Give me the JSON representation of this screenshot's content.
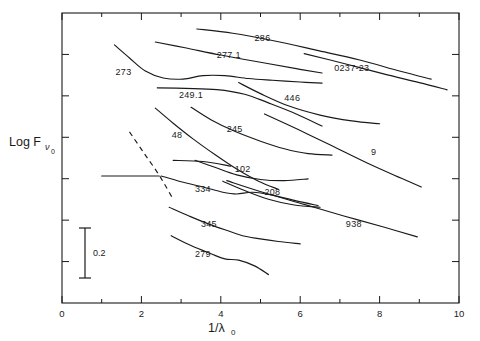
{
  "figure": {
    "kind": "scientific-line-plot",
    "background_color": "#ffffff",
    "ink_color": "#1a1a1a"
  },
  "axes": {
    "x_label": "1/λ",
    "x_label_sub": "0",
    "y_label": "Log F",
    "y_label_sub_nu": "ν",
    "y_label_sub_zero": "0",
    "x_ticks": [
      "0",
      "2",
      "4",
      "6",
      "8",
      "10"
    ],
    "x_tick_values": [
      0,
      2,
      4,
      6,
      8,
      10
    ],
    "x_minor_tick_values": [
      1,
      3,
      5,
      7,
      9
    ],
    "xlim": [
      0,
      10
    ],
    "y_tick_count": 6,
    "frame": "box",
    "grid": false
  },
  "scalebar": {
    "label": "0.2",
    "value": 0.2
  },
  "chart_data": {
    "type": "line",
    "title": "",
    "xlabel": "1/λ0",
    "ylabel": "Log Fν0",
    "xlim": [
      0,
      10
    ],
    "ylim": [
      0,
      1
    ],
    "grid": false,
    "legend": "inline-curve-labels",
    "note": "Y axis is relative log flux with arbitrary offsets per curve; only a 0.2 dex scale bar is given. Curve x values read from the 1/λ0 axis, y values are normalized figure coordinates (1 = top of frame, 0 = bottom).",
    "series": [
      {
        "name": "286",
        "label": "286",
        "label_x": 5.05,
        "label_y": 0.905,
        "x": [
          3.4,
          4.3,
          5.3,
          6.4,
          7.5,
          8.5,
          9.3
        ],
        "y": [
          0.945,
          0.93,
          0.905,
          0.872,
          0.838,
          0.8,
          0.772
        ]
      },
      {
        "name": "0237-23",
        "label": "0237-23",
        "label_x": 7.3,
        "label_y": 0.8,
        "x": [
          6.1,
          7.1,
          8.1,
          9.0,
          9.7
        ],
        "y": [
          0.86,
          0.826,
          0.79,
          0.76,
          0.735
        ]
      },
      {
        "name": "277.1",
        "label": "277.1",
        "label_x": 4.2,
        "label_y": 0.845,
        "x": [
          2.35,
          3.1,
          4.0,
          5.0,
          5.9,
          6.55
        ],
        "y": [
          0.9,
          0.88,
          0.855,
          0.83,
          0.808,
          0.793
        ]
      },
      {
        "name": "273",
        "label": "273",
        "label_x": 1.55,
        "label_y": 0.787,
        "x": [
          1.32,
          1.7,
          2.1,
          2.55,
          3.05,
          3.55,
          4.1,
          4.7,
          5.3,
          6.0,
          6.55
        ],
        "y": [
          0.89,
          0.845,
          0.8,
          0.776,
          0.772,
          0.784,
          0.784,
          0.774,
          0.768,
          0.762,
          0.758
        ]
      },
      {
        "name": "249.1",
        "label": "249.1",
        "label_x": 3.25,
        "label_y": 0.707,
        "x": [
          2.4,
          3.1,
          3.9,
          4.6,
          5.2,
          5.9,
          6.55
        ],
        "y": [
          0.742,
          0.74,
          0.736,
          0.72,
          0.69,
          0.652,
          0.61
        ]
      },
      {
        "name": "446",
        "label": "446",
        "label_x": 5.8,
        "label_y": 0.695,
        "x": [
          4.45,
          5.0,
          5.7,
          6.5,
          7.3,
          8.0
        ],
        "y": [
          0.76,
          0.722,
          0.68,
          0.648,
          0.628,
          0.618
        ]
      },
      {
        "name": "245",
        "label": "245",
        "label_x": 4.35,
        "label_y": 0.588,
        "x": [
          3.25,
          3.75,
          4.35,
          5.0,
          5.6,
          6.2,
          6.8
        ],
        "y": [
          0.675,
          0.632,
          0.592,
          0.558,
          0.532,
          0.515,
          0.51
        ]
      },
      {
        "name": "48",
        "label": "48",
        "label_x": 2.9,
        "label_y": 0.57,
        "x": [
          2.35,
          2.8,
          3.3,
          3.85,
          4.4,
          4.95,
          5.45
        ],
        "y": [
          0.672,
          0.62,
          0.566,
          0.512,
          0.462,
          0.42,
          0.392
        ]
      },
      {
        "name": "9",
        "label": "9",
        "label_x": 7.85,
        "label_y": 0.51,
        "x": [
          5.1,
          5.95,
          6.8,
          7.7,
          8.55,
          9.05
        ],
        "y": [
          0.652,
          0.598,
          0.542,
          0.482,
          0.43,
          0.4
        ]
      },
      {
        "name": "102",
        "label": "102",
        "label_x": 4.55,
        "label_y": 0.452,
        "x": [
          3.35,
          3.85,
          4.4,
          5.0,
          5.6,
          6.2
        ],
        "y": [
          0.492,
          0.468,
          0.442,
          0.426,
          0.422,
          0.428
        ]
      },
      {
        "name": "334",
        "label": "334",
        "label_x": 3.55,
        "label_y": 0.382,
        "x": [
          2.5,
          3.0,
          3.55,
          4.05,
          4.4,
          4.8,
          5.3,
          5.9,
          6.45
        ],
        "y": [
          0.438,
          0.418,
          0.4,
          0.382,
          0.376,
          0.382,
          0.372,
          0.352,
          0.336
        ]
      },
      {
        "name": "208",
        "label": "208",
        "label_x": 5.3,
        "label_y": 0.372,
        "x": [
          4.05,
          4.6,
          5.2,
          5.85,
          6.5
        ],
        "y": [
          0.42,
          0.388,
          0.358,
          0.338,
          0.33
        ]
      },
      {
        "name": "345",
        "label": "345",
        "label_x": 3.7,
        "label_y": 0.262,
        "x": [
          2.7,
          3.2,
          3.7,
          4.2,
          4.55,
          4.95,
          5.45,
          6.0
        ],
        "y": [
          0.33,
          0.3,
          0.272,
          0.248,
          0.232,
          0.222,
          0.212,
          0.204
        ]
      },
      {
        "name": "938",
        "label": "938",
        "label_x": 7.35,
        "label_y": 0.262,
        "x": [
          4.15,
          5.1,
          6.1,
          7.1,
          8.1,
          8.95
        ],
        "y": [
          0.422,
          0.38,
          0.34,
          0.3,
          0.262,
          0.228
        ]
      },
      {
        "name": "279",
        "label": "279",
        "label_x": 3.55,
        "label_y": 0.158,
        "x": [
          2.75,
          3.25,
          3.75,
          4.1,
          4.45,
          4.85,
          5.2
        ],
        "y": [
          0.232,
          0.198,
          0.17,
          0.152,
          0.148,
          0.128,
          0.098
        ]
      },
      {
        "name": "unlabeled-dashed",
        "label": "",
        "style": "dashed",
        "x": [
          1.7,
          2.05,
          2.45,
          2.8
        ],
        "y": [
          0.59,
          0.52,
          0.44,
          0.358
        ]
      },
      {
        "name": "unlabeled-horizontal-left",
        "label": "",
        "x": [
          1.0,
          1.8,
          2.45
        ],
        "y": [
          0.438,
          0.438,
          0.438
        ]
      },
      {
        "name": "unlabeled-short-upper",
        "label": "",
        "x": [
          2.8,
          3.55,
          4.25
        ],
        "y": [
          0.492,
          0.488,
          0.472
        ]
      }
    ]
  }
}
